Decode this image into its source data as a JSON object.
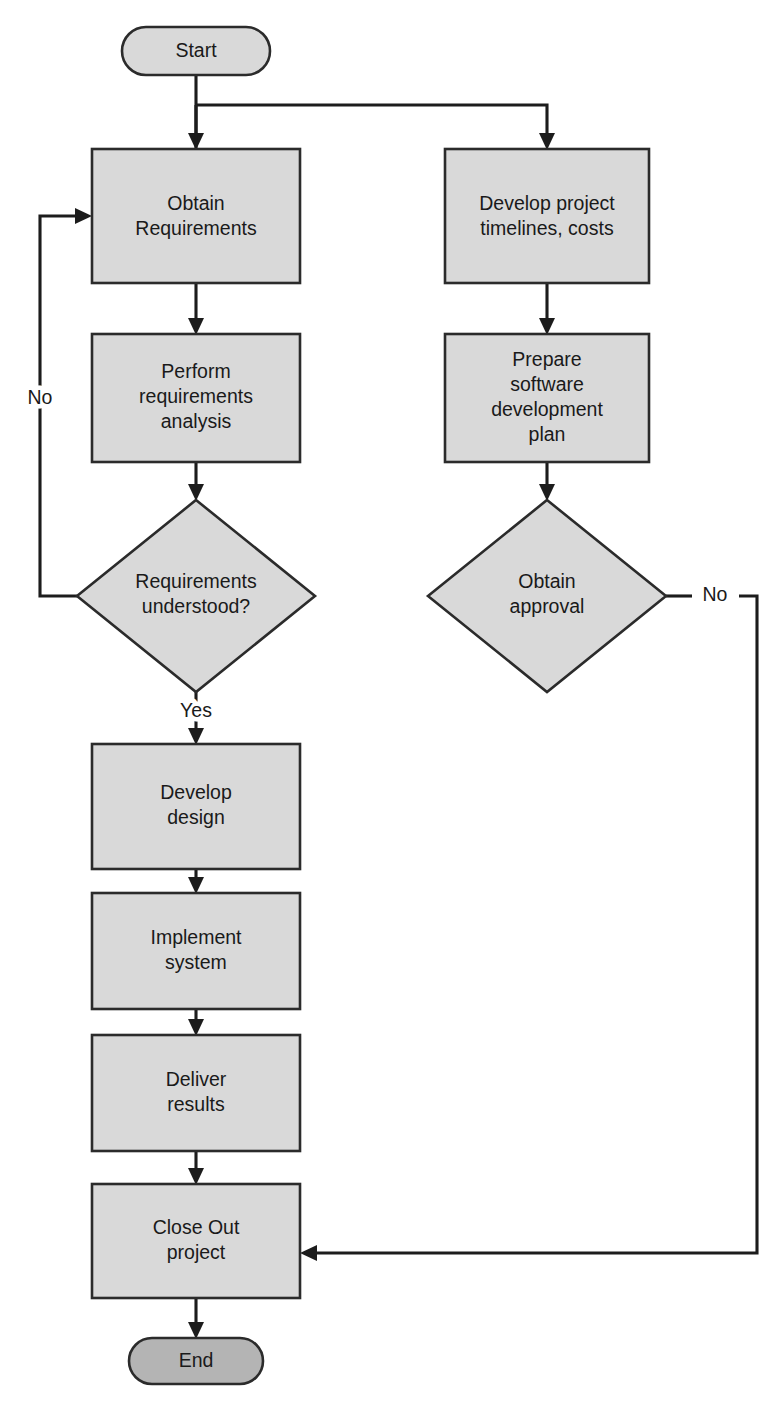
{
  "diagram": {
    "type": "flowchart",
    "colors": {
      "process_fill": "#d9d9d9",
      "terminator_start_fill": "#d9d9d9",
      "terminator_end_fill": "#b4b4b4",
      "decision_fill": "#d9d9d9",
      "stroke": "#2b2b2b",
      "edge": "#1c1c1c",
      "text": "#1a1a1a",
      "background": "#ffffff"
    },
    "nodes": {
      "start": {
        "shape": "terminator",
        "label": "Start",
        "cx": 196,
        "cy": 51,
        "width": 148,
        "height": 48
      },
      "obtain_requirements": {
        "shape": "process",
        "label_lines": [
          "Obtain",
          "Requirements"
        ],
        "x": 92,
        "y": 149,
        "width": 208,
        "height": 134
      },
      "develop_project_timelines": {
        "shape": "process",
        "label_lines": [
          "Develop project",
          "timelines, costs"
        ],
        "x": 445,
        "y": 149,
        "width": 204,
        "height": 134
      },
      "perform_requirements_analysis": {
        "shape": "process",
        "label_lines": [
          "Perform",
          "requirements",
          "analysis"
        ],
        "x": 92,
        "y": 334,
        "width": 208,
        "height": 128
      },
      "prepare_software_development_plan": {
        "shape": "process",
        "label_lines": [
          "Prepare",
          "software",
          "development",
          "plan"
        ],
        "x": 445,
        "y": 334,
        "width": 204,
        "height": 128
      },
      "requirements_understood": {
        "shape": "decision",
        "label_lines": [
          "Requirements",
          "understood?"
        ],
        "cx": 196,
        "cy": 596,
        "width": 238,
        "height": 192
      },
      "obtain_approval": {
        "shape": "decision",
        "label_lines": [
          "Obtain",
          "approval"
        ],
        "cx": 547,
        "cy": 596,
        "width": 238,
        "height": 192
      },
      "develop_design": {
        "shape": "process",
        "label_lines": [
          "Develop",
          "design"
        ],
        "x": 92,
        "y": 744,
        "width": 208,
        "height": 125
      },
      "implement_system": {
        "shape": "process",
        "label_lines": [
          "Implement",
          "system"
        ],
        "x": 92,
        "y": 893,
        "width": 208,
        "height": 116
      },
      "deliver_results": {
        "shape": "process",
        "label_lines": [
          "Deliver",
          "results"
        ],
        "x": 92,
        "y": 1035,
        "width": 208,
        "height": 116
      },
      "close_out_project": {
        "shape": "process",
        "label_lines": [
          "Close Out",
          "project"
        ],
        "x": 92,
        "y": 1184,
        "width": 208,
        "height": 114
      },
      "end": {
        "shape": "terminator",
        "label": "End",
        "cx": 196,
        "cy": 1361,
        "width": 134,
        "height": 46
      }
    },
    "edge_labels": {
      "requirements_no": "No",
      "requirements_yes": "Yes",
      "approval_no": "No"
    },
    "edges": [
      {
        "name": "start-to-branch",
        "from": "start",
        "to": "branch-point"
      },
      {
        "name": "branch-to-obtain-requirements",
        "from": "branch-point",
        "to": "obtain_requirements"
      },
      {
        "name": "branch-to-develop-project-timelines",
        "from": "branch-point",
        "to": "develop_project_timelines"
      },
      {
        "name": "obtain-requirements-to-analysis",
        "from": "obtain_requirements",
        "to": "perform_requirements_analysis"
      },
      {
        "name": "analysis-to-decision",
        "from": "perform_requirements_analysis",
        "to": "requirements_understood"
      },
      {
        "name": "decision-no-loop",
        "from": "requirements_understood",
        "to": "obtain_requirements",
        "label": "No"
      },
      {
        "name": "decision-yes-to-develop-design",
        "from": "requirements_understood",
        "to": "develop_design",
        "label": "Yes"
      },
      {
        "name": "timelines-to-plan",
        "from": "develop_project_timelines",
        "to": "prepare_software_development_plan"
      },
      {
        "name": "plan-to-approval",
        "from": "prepare_software_development_plan",
        "to": "obtain_approval"
      },
      {
        "name": "approval-no-to-close-out",
        "from": "obtain_approval",
        "to": "close_out_project",
        "label": "No"
      },
      {
        "name": "develop-design-to-implement",
        "from": "develop_design",
        "to": "implement_system"
      },
      {
        "name": "implement-to-deliver",
        "from": "implement_system",
        "to": "deliver_results"
      },
      {
        "name": "deliver-to-close-out",
        "from": "deliver_results",
        "to": "close_out_project"
      },
      {
        "name": "close-out-to-end",
        "from": "close_out_project",
        "to": "end"
      }
    ]
  }
}
